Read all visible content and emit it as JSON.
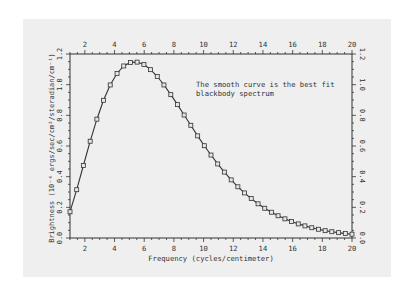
{
  "chart_data": {
    "type": "scatter",
    "title": "",
    "xlabel": "Frequency (cycles/centimeter)",
    "ylabel": "Brightness (10⁻⁴ ergs/sec/cm²/steradian/cm⁻¹)",
    "xlim": [
      1,
      20
    ],
    "ylim": [
      0,
      1.2
    ],
    "xticks": [
      2,
      4,
      6,
      8,
      10,
      12,
      14,
      16,
      18,
      20
    ],
    "yticks": [
      0,
      0.2,
      0.4,
      0.6,
      0.8,
      1.0,
      1.2
    ],
    "ytick_labels": [
      "0.0",
      "0.2",
      "0.4",
      "0.6",
      "0.8",
      "1.0",
      "1.2"
    ],
    "right_ytick_labels": [
      "0.0",
      "0.2",
      "0.4",
      "0.6",
      "0.8",
      "1.0",
      "1.2"
    ],
    "grid": false,
    "annotation": {
      "line1": "The smooth curve is the best fit",
      "line2": "blackbody spectrum",
      "x": 10.5,
      "y": 0.98
    },
    "series": [
      {
        "name": "Measured spectrum (data points)",
        "marker": "square",
        "x": [
          1.0,
          1.45,
          1.9,
          2.36,
          2.81,
          3.26,
          3.71,
          4.17,
          4.62,
          5.07,
          5.52,
          5.98,
          6.43,
          6.88,
          7.33,
          7.79,
          8.24,
          8.69,
          9.14,
          9.6,
          10.05,
          10.5,
          10.95,
          11.4,
          11.86,
          12.31,
          12.76,
          13.21,
          13.67,
          14.12,
          14.57,
          15.02,
          15.48,
          15.93,
          16.38,
          16.83,
          17.29,
          17.74,
          18.19,
          18.64,
          19.1,
          19.55,
          20.0
        ],
        "values": [
          0.171,
          0.315,
          0.473,
          0.631,
          0.775,
          0.898,
          0.998,
          1.073,
          1.122,
          1.145,
          1.147,
          1.131,
          1.098,
          1.053,
          0.998,
          0.935,
          0.87,
          0.802,
          0.735,
          0.666,
          0.602,
          0.541,
          0.483,
          0.43,
          0.379,
          0.334,
          0.294,
          0.257,
          0.223,
          0.194,
          0.168,
          0.145,
          0.125,
          0.107,
          0.092,
          0.079,
          0.067,
          0.057,
          0.048,
          0.041,
          0.035,
          0.029,
          0.025
        ]
      },
      {
        "name": "Best fit blackbody spectrum",
        "type": "line",
        "x_from_series": 0
      }
    ]
  },
  "colors": {
    "panel": "#efefef",
    "ink": "#333333",
    "background": "#ffffff"
  }
}
